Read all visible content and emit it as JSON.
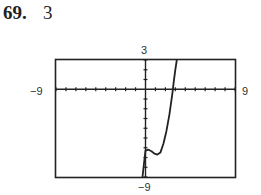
{
  "problem": {
    "number": "69.",
    "value": "3"
  },
  "window_labels": {
    "ymax": "3",
    "xmin": "−9",
    "xmax": "9",
    "ymin": "−9"
  },
  "chart_data": {
    "type": "line",
    "title": "",
    "xlabel": "",
    "ylabel": "",
    "xlim": [
      -9,
      9
    ],
    "ylim": [
      -9,
      3
    ],
    "grid": false,
    "tick_spacing": 1,
    "series": [
      {
        "name": "f(x)",
        "x": [
          -0.3,
          -0.15,
          0,
          0.3,
          0.6,
          0.9,
          1.2,
          1.5,
          1.8,
          2.1,
          2.4,
          2.7,
          2.85,
          3.0,
          3.15
        ],
        "y": [
          -9,
          -7.6,
          -6.3,
          -6.2,
          -6.35,
          -6.6,
          -6.7,
          -6.5,
          -5.6,
          -4.3,
          -2.6,
          -0.5,
          0.8,
          2.0,
          3.0
        ]
      }
    ]
  }
}
